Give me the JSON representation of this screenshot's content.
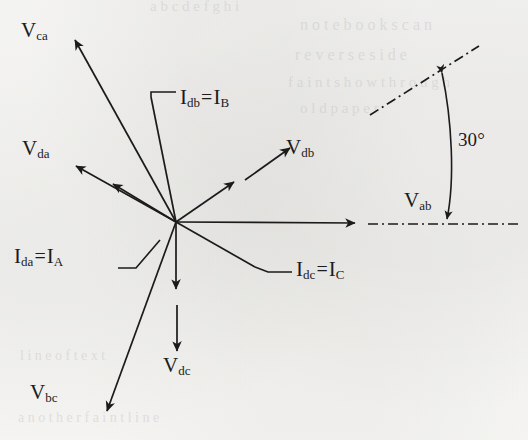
{
  "figure": {
    "type": "phasor-diagram",
    "title": "",
    "background_color": "#fbfbfa",
    "ink_color": "#1b1b1b",
    "origin": {
      "x": 176,
      "y": 222
    },
    "angle_annotation": {
      "value": "30",
      "unit": "°",
      "text": "30°"
    },
    "labels": {
      "v_ca": {
        "base": "V",
        "sub": "ca"
      },
      "v_da": {
        "base": "V",
        "sub": "da"
      },
      "v_db": {
        "base": "V",
        "sub": "db"
      },
      "v_dc": {
        "base": "V",
        "sub": "dc"
      },
      "v_bc": {
        "base": "V",
        "sub": "bc"
      },
      "v_ab": {
        "base": "V",
        "sub": "ab"
      },
      "i_db": {
        "base": "I",
        "sub": "db",
        "eq": "=",
        "base2": "I",
        "sub2": "B"
      },
      "i_da": {
        "base": "I",
        "sub": "da",
        "eq": "=",
        "base2": "I",
        "sub2": "A"
      },
      "i_dc": {
        "base": "I",
        "sub": "dc",
        "eq": "=",
        "base2": "I",
        "sub2": "C"
      }
    },
    "vectors": [
      {
        "name": "V_ca",
        "label": "V_ca",
        "angle_deg": 127,
        "length": 205,
        "style": "solid-arrow"
      },
      {
        "name": "V_da",
        "label": "V_da",
        "angle_deg": 153,
        "length": 108,
        "style": "solid-arrow"
      },
      {
        "name": "I_da",
        "label": "I_da = I_A",
        "angle_deg": 143,
        "length": 75,
        "style": "solid-arrow"
      },
      {
        "name": "I_db",
        "label": "I_db = I_B",
        "angle_deg": 79,
        "length": 132,
        "style": "solid-line"
      },
      {
        "name": "I_dc",
        "label": "I_dc = I_C",
        "angle_deg": -24,
        "length": 92,
        "style": "solid-line"
      },
      {
        "name": "V_db",
        "label": "V_db",
        "angle_deg": 35,
        "length": 70,
        "style": "solid-arrow"
      },
      {
        "name": "V_db_outer",
        "label": "V_db",
        "angle_deg": 35,
        "length": 142,
        "style": "solid-arrow-detached"
      },
      {
        "name": "V_ab",
        "label": "V_ab",
        "angle_deg": 0,
        "length": 156,
        "style": "solid-arrow"
      },
      {
        "name": "V_dc",
        "label": "V_dc",
        "angle_deg": -90,
        "length": 68,
        "style": "solid-arrow"
      },
      {
        "name": "V_dc_outer",
        "label": "V_dc",
        "angle_deg": -90,
        "length": 128,
        "style": "solid-arrow-detached"
      },
      {
        "name": "V_bc",
        "label": "V_bc",
        "angle_deg": -118,
        "length": 212,
        "style": "solid-arrow"
      }
    ],
    "reference_lines": [
      {
        "name": "horizontal-reference",
        "style": "dash-dot",
        "from": {
          "x": 368,
          "y": 224
        },
        "to": {
          "x": 522,
          "y": 224
        }
      },
      {
        "name": "inclined-reference-30deg",
        "style": "dash-dot",
        "from": {
          "x": 370,
          "y": 114
        },
        "to": {
          "x": 478,
          "y": 46
        }
      }
    ],
    "ghost_text": [
      {
        "text": "a  b  c  d  e  f  g  h  i",
        "x": 150,
        "y": 4
      },
      {
        "text": "n o t e   b o o k   s c a n",
        "x": 300,
        "y": 22
      },
      {
        "text": "r e v e r s e   s i d e",
        "x": 295,
        "y": 52
      },
      {
        "text": "f a i n t   s h o w   t h r o u g h",
        "x": 288,
        "y": 80
      },
      {
        "text": "o l d   p a p e r",
        "x": 300,
        "y": 104
      },
      {
        "text": "l i n e   o f   t e x t",
        "x": 20,
        "y": 352
      },
      {
        "text": "a n o t h e r   f a i n t   l i n e",
        "x": 18,
        "y": 414
      }
    ]
  }
}
